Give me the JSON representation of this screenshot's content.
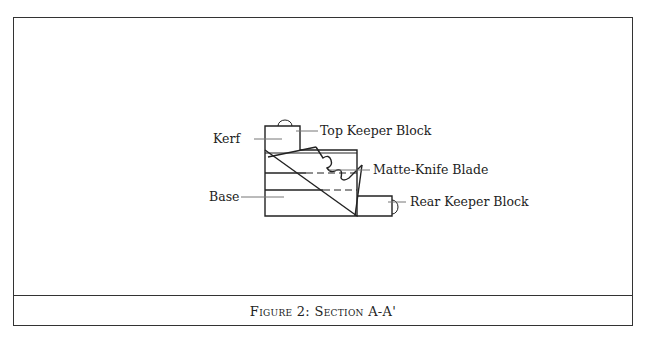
{
  "figure": {
    "caption": "Figure 2:  Section A-A'",
    "labels": {
      "top_keeper_block": "Top Keeper Block",
      "kerf": "Kerf",
      "matte_knife_blade": "Matte-Knife Blade",
      "base": "Base",
      "rear_keeper_block": "Rear Keeper Block"
    }
  }
}
